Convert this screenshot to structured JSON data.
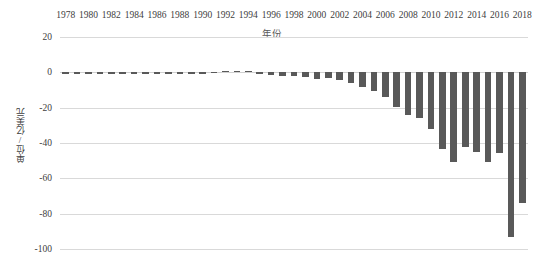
{
  "chart_data": {
    "type": "bar",
    "title": "",
    "subtitle": "",
    "xlabel": "年份",
    "ylabel": "单位/亿美元",
    "xlim": [
      1977.5,
      2018.5
    ],
    "ylim": [
      -100,
      20
    ],
    "grid": true,
    "legend": false,
    "legend_position": "none",
    "x_axis_position": "top",
    "bar_color": "#595959",
    "gridline_color": "#d9d9d9",
    "text_color": "#404040",
    "y_ticks": [
      20,
      0,
      -20,
      -40,
      -60,
      -80,
      -100
    ],
    "y_tick_labels": [
      "20",
      "0",
      "-20",
      "-40",
      "-60",
      "-80",
      "-100"
    ],
    "x_tick_labels": [
      "1978",
      "1980",
      "1982",
      "1984",
      "1986",
      "1988",
      "1990",
      "1992",
      "1994",
      "1996",
      "1998",
      "2000",
      "2002",
      "2004",
      "2006",
      "2008",
      "2010",
      "2012",
      "2014",
      "2016",
      "2018"
    ],
    "categories": [
      "1978",
      "1979",
      "1980",
      "1981",
      "1982",
      "1983",
      "1984",
      "1985",
      "1986",
      "1987",
      "1988",
      "1989",
      "1990",
      "1991",
      "1992",
      "1993",
      "1994",
      "1995",
      "1996",
      "1997",
      "1998",
      "1999",
      "2000",
      "2001",
      "2002",
      "2003",
      "2004",
      "2005",
      "2006",
      "2007",
      "2008",
      "2009",
      "2010",
      "2011",
      "2012",
      "2013",
      "2014",
      "2015",
      "2016",
      "2017",
      "2018"
    ],
    "values": [
      -0.3,
      -0.4,
      -0.5,
      -0.4,
      -0.3,
      -0.6,
      -1.2,
      -1.0,
      -0.8,
      -0.7,
      -0.9,
      -0.6,
      -0.4,
      0.3,
      0.8,
      1.0,
      0.6,
      -0.5,
      -1.5,
      -2.0,
      -2.2,
      -2.6,
      -3.5,
      -3.2,
      -4.6,
      -6.0,
      -8.5,
      -10.5,
      -14.0,
      -19.5,
      -24.0,
      -26.0,
      -32.0,
      -43.5,
      -51.0,
      -42.0,
      -45.0,
      -51.0,
      -45.5,
      -93.0,
      -74.0
    ]
  }
}
